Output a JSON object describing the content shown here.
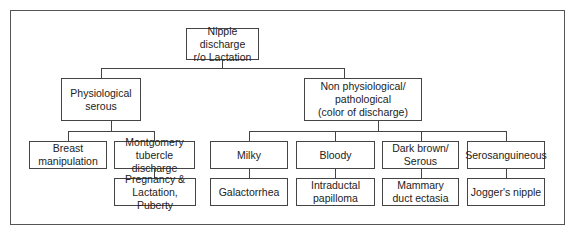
{
  "diagram": {
    "type": "flowchart",
    "root": {
      "label": "Nipple discharge\nr/o Lactation"
    },
    "branches": [
      {
        "label": "Physiological\nserous",
        "children": [
          {
            "label": "Breast\nmanipulation"
          },
          {
            "label": "Montgomery\ntubercle discharge",
            "result": "Pregnancy &\nLactation, Puberty"
          }
        ]
      },
      {
        "label": "Non physiological/\npathological\n(color of discharge)",
        "children": [
          {
            "label": "Milky",
            "result": "Galactorrhea"
          },
          {
            "label": "Bloody",
            "result": "Intraductal\npapilloma"
          },
          {
            "label": "Dark brown/\nSerous",
            "result": "Mammary\nduct ectasia"
          },
          {
            "label": "Serosanguineous",
            "result": "Jogger's nipple"
          }
        ]
      }
    ]
  }
}
